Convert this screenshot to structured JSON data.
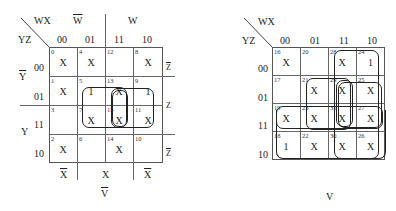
{
  "maps": [
    {
      "name": "left-kmap",
      "row_var_label": "YZ",
      "col_var_label": "WX",
      "col_headers": [
        "00",
        "01",
        "11",
        "10"
      ],
      "row_headers": [
        "00",
        "01",
        "11",
        "10"
      ],
      "top_group_labels": [
        "W",
        "W"
      ],
      "left_group_labels": [
        "Y",
        "Y"
      ],
      "right_group_labels": [
        "Z",
        "Z",
        "Z"
      ],
      "bottom_group_labels": [
        "X",
        "X",
        "X"
      ],
      "caption": "V",
      "cells": [
        [
          {
            "num": "0",
            "val": "X"
          },
          {
            "num": "4",
            "val": "X"
          },
          {
            "num": "12",
            "val": ""
          },
          {
            "num": "8",
            "val": "X"
          }
        ],
        [
          {
            "num": "1",
            "val": "X"
          },
          {
            "num": "5",
            "val": "1"
          },
          {
            "num": "13",
            "val": "X"
          },
          {
            "num": "9",
            "val": "1"
          }
        ],
        [
          {
            "num": "3",
            "val": ""
          },
          {
            "num": "7",
            "val": "X"
          },
          {
            "num": "15",
            "val": "X"
          },
          {
            "num": "11",
            "val": "X"
          }
        ],
        [
          {
            "num": "2",
            "val": "X"
          },
          {
            "num": "6",
            "val": ""
          },
          {
            "num": "14",
            "val": "X"
          },
          {
            "num": "10",
            "val": ""
          }
        ]
      ]
    },
    {
      "name": "right-kmap",
      "row_var_label": "YZ",
      "col_var_label": "WX",
      "col_headers": [
        "00",
        "01",
        "11",
        "10"
      ],
      "row_headers": [
        "00",
        "01",
        "11",
        "10"
      ],
      "caption": "V",
      "cells": [
        [
          {
            "num": "16",
            "val": "X"
          },
          {
            "num": "20",
            "val": ""
          },
          {
            "num": "28",
            "val": "X"
          },
          {
            "num": "24",
            "val": "1"
          }
        ],
        [
          {
            "num": "17",
            "val": ""
          },
          {
            "num": "21",
            "val": "X"
          },
          {
            "num": "29",
            "val": "X"
          },
          {
            "num": "25",
            "val": "X"
          }
        ],
        [
          {
            "num": "19",
            "val": "X"
          },
          {
            "num": "23",
            "val": "X"
          },
          {
            "num": "31",
            "val": "X"
          },
          {
            "num": "27",
            "val": "X"
          }
        ],
        [
          {
            "num": "18",
            "val": "1"
          },
          {
            "num": "22",
            "val": "X"
          },
          {
            "num": "30",
            "val": "X"
          },
          {
            "num": "26",
            "val": "X"
          }
        ]
      ]
    }
  ]
}
